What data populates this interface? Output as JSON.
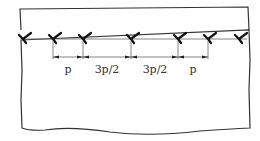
{
  "diagram": {
    "type": "weld-spacing",
    "plate": {
      "x1": 21,
      "y1": 8,
      "x2": 248,
      "y2_bottom_wavy": true
    },
    "reference_line_y": 39,
    "dimension_line_y": 57,
    "markers_x": [
      23,
      53,
      83,
      131,
      178,
      208,
      239
    ],
    "dimensions": [
      {
        "from": 53,
        "to": 83,
        "label": "p"
      },
      {
        "from": 83,
        "to": 131,
        "label": "3p/2"
      },
      {
        "from": 131,
        "to": 178,
        "label": "3p/2"
      },
      {
        "from": 178,
        "to": 208,
        "label": "p"
      }
    ],
    "colors": {
      "stroke": "#222222",
      "thin": "#555555"
    }
  },
  "labels": {
    "d0": "p",
    "d1": "3p/2",
    "d2": "3p/2",
    "d3": "p"
  }
}
